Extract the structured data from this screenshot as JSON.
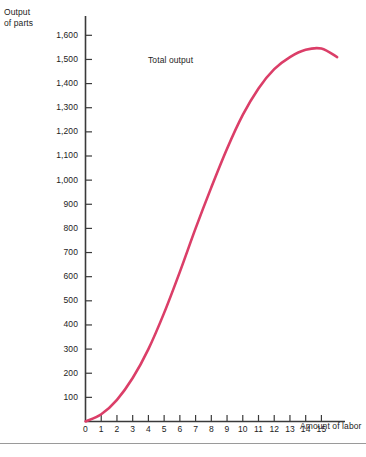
{
  "chart_data": {
    "type": "line",
    "title": "",
    "xlabel": "Amount of labor",
    "ylabel": "Output of parts",
    "ylabel_lines": [
      "Output",
      "of parts"
    ],
    "series_label": "Total output",
    "line_color": "#DB3E68",
    "axis_color": "#3a3a3a",
    "grid": false,
    "legend_position": "inline-annotation",
    "xlim": [
      0,
      16.5
    ],
    "ylim": [
      0,
      1680
    ],
    "xticks": [
      0,
      1,
      2,
      3,
      4,
      5,
      6,
      7,
      8,
      9,
      10,
      11,
      12,
      13,
      14,
      15
    ],
    "xtick_labels": [
      "0",
      "1",
      "2",
      "3",
      "4",
      "5",
      "6",
      "7",
      "8",
      "9",
      "10",
      "11",
      "12",
      "13",
      "14",
      "15"
    ],
    "yticks": [
      100,
      200,
      300,
      400,
      500,
      600,
      700,
      800,
      900,
      1000,
      1100,
      1200,
      1300,
      1400,
      1500,
      1600
    ],
    "ytick_labels": [
      "100",
      "200",
      "300",
      "400",
      "500",
      "600",
      "700",
      "800",
      "900",
      "1,000",
      "1,100",
      "1,200",
      "1,300",
      "1,400",
      "1,500",
      "1,600"
    ],
    "x": [
      0,
      1,
      2,
      3,
      4,
      5,
      6,
      7,
      8,
      9,
      10,
      11,
      12,
      13,
      14,
      15,
      16
    ],
    "values": [
      0,
      30,
      90,
      180,
      300,
      450,
      620,
      800,
      970,
      1130,
      1270,
      1380,
      1460,
      1510,
      1540,
      1545,
      1510
    ],
    "series": [
      {
        "name": "Total output",
        "values": [
          0,
          30,
          90,
          180,
          300,
          450,
          620,
          800,
          970,
          1130,
          1270,
          1380,
          1460,
          1510,
          1540,
          1545,
          1510
        ]
      }
    ]
  }
}
